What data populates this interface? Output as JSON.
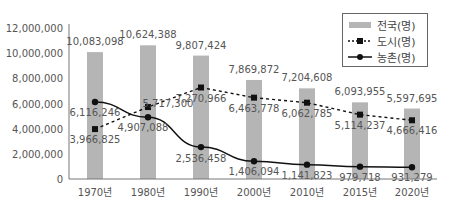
{
  "chart_data": {
    "type": "bar+line",
    "title": "",
    "xlabel": "",
    "ylabel": "",
    "ylim": [
      0,
      12000000
    ],
    "yticks": [
      "0",
      "2,000,000",
      "4,000,000",
      "6,000,000",
      "8,000,000",
      "10,000,000",
      "12,000,000"
    ],
    "ytick_values": [
      0,
      2000000,
      4000000,
      6000000,
      8000000,
      10000000,
      12000000
    ],
    "categories": [
      "1970년",
      "1980년",
      "1990년",
      "2000년",
      "2010년",
      "2015년",
      "2020년"
    ],
    "grid": false,
    "legend_position": "top-right",
    "series": [
      {
        "name": "전국(명)",
        "type": "bar",
        "color": "#b5b5b5",
        "values": [
          10083098,
          10624388,
          9807424,
          7869872,
          7204608,
          6093955,
          5597695
        ],
        "labels": [
          "10,083,098",
          "10,624,388",
          "9,807,424",
          "7,869,872",
          "7,204,608",
          "6,093,955",
          "5,597,695"
        ]
      },
      {
        "name": "도시(명)",
        "type": "line",
        "style": "dashed",
        "marker": "square",
        "color": "#111111",
        "values": [
          3966825,
          5717300,
          7270966,
          6463778,
          6062785,
          5114237,
          4666416
        ],
        "labels": [
          "3,966,825",
          "5,717,300",
          "7,270,966",
          "6,463,778",
          "6,062,785",
          "5,114,237",
          "4,666,416"
        ]
      },
      {
        "name": "농촌(명)",
        "type": "line",
        "style": "solid",
        "marker": "circle",
        "color": "#111111",
        "values": [
          6116246,
          4907088,
          2536458,
          1406094,
          1141823,
          979718,
          931279
        ],
        "labels": [
          "6,116,246",
          "4,907,088",
          "2,536,458",
          "1,406,094",
          "1,141,823",
          "979,718",
          "931,279"
        ]
      }
    ]
  },
  "legend": {
    "items": [
      {
        "label": "전국(명)"
      },
      {
        "label": "도시(명)"
      },
      {
        "label": "농촌(명)"
      }
    ]
  }
}
